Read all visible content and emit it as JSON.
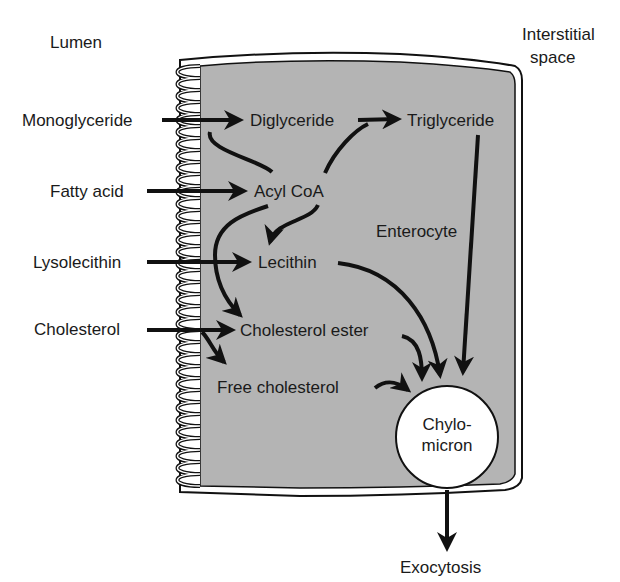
{
  "regions": {
    "lumen": "Lumen",
    "interstitial_line1": "Interstitial",
    "interstitial_line2": "space",
    "cell": "Enterocyte"
  },
  "inputs": {
    "monoglyceride": "Monoglyceride",
    "fatty_acid": "Fatty acid",
    "lysolecithin": "Lysolecithin",
    "cholesterol": "Cholesterol"
  },
  "intermediates": {
    "diglyceride": "Diglyceride",
    "triglyceride": "Triglyceride",
    "acyl_coa": "Acyl CoA",
    "lecithin": "Lecithin",
    "cholesterol_ester": "Cholesterol ester",
    "free_cholesterol": "Free cholesterol"
  },
  "output": {
    "chylomicron_line1": "Chylo-",
    "chylomicron_line2": "micron",
    "exocytosis": "Exocytosis"
  },
  "colors": {
    "cell_fill": "#b4b4b4",
    "stroke": "#111111",
    "background": "#ffffff"
  }
}
